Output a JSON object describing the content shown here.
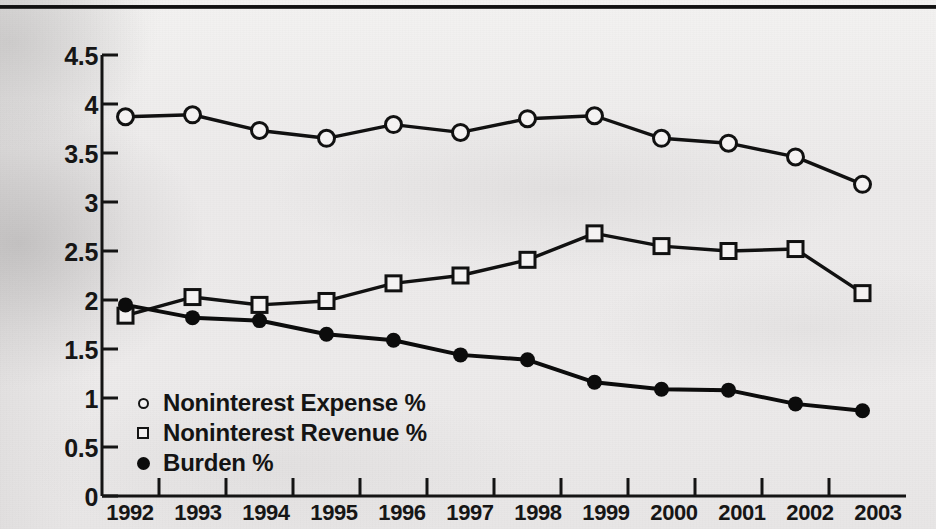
{
  "chart_data": {
    "type": "line",
    "title": "",
    "subtitle": "",
    "xlabel": "",
    "ylabel": "",
    "categories": [
      "1992",
      "1993",
      "1994",
      "1995",
      "1996",
      "1997",
      "1998",
      "1999",
      "2000",
      "2001",
      "2002",
      "2003"
    ],
    "x": [
      1992,
      1993,
      1994,
      1995,
      1996,
      1997,
      1998,
      1999,
      2000,
      2001,
      2002,
      2003
    ],
    "ylim": [
      0,
      4.5
    ],
    "yticks": [
      0,
      0.5,
      1,
      1.5,
      2,
      2.5,
      3,
      3.5,
      4,
      4.5
    ],
    "ytick_labels": [
      "0",
      "0.5",
      "1",
      "1.5",
      "2",
      "2.5",
      "3",
      "3.5",
      "4",
      "4.5"
    ],
    "grid": false,
    "legend_position": "inside-lower-left",
    "series": [
      {
        "name": "Noninterest Expense %",
        "marker": "open-circle",
        "color": "#111111",
        "values": [
          3.87,
          3.89,
          3.73,
          3.65,
          3.79,
          3.71,
          3.85,
          3.88,
          3.65,
          3.6,
          3.46,
          3.18
        ]
      },
      {
        "name": "Noninterest Revenue %",
        "marker": "open-square",
        "color": "#111111",
        "values": [
          1.84,
          2.03,
          1.95,
          1.99,
          2.17,
          2.25,
          2.41,
          2.68,
          2.55,
          2.5,
          2.52,
          2.07
        ]
      },
      {
        "name": "Burden %",
        "marker": "filled-circle",
        "color": "#0c0c0c",
        "values": [
          1.95,
          1.82,
          1.79,
          1.65,
          1.59,
          1.44,
          1.39,
          1.16,
          1.09,
          1.08,
          0.94,
          0.87
        ]
      }
    ]
  },
  "legend": {
    "items": [
      {
        "label": "Noninterest Expense %",
        "marker": "open-circle"
      },
      {
        "label": "Noninterest Revenue %",
        "marker": "open-square"
      },
      {
        "label": "Burden %",
        "marker": "filled-circle"
      }
    ]
  },
  "axis": {
    "y_labels": [
      "4.5",
      "4",
      "3.5",
      "3",
      "2.5",
      "2",
      "1.5",
      "1",
      "0.5",
      "0"
    ],
    "x_labels": [
      "1992",
      "1993",
      "1994",
      "1995",
      "1996",
      "1997",
      "1998",
      "1999",
      "2000",
      "2001",
      "2002",
      "2003"
    ]
  },
  "colors": {
    "ink": "#111111",
    "paper": "#eceaea",
    "rule": "#111111"
  }
}
